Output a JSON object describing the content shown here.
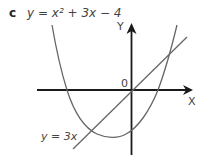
{
  "figure": {
    "part_label": "c",
    "curve_equation": "y = x² + 3x − 4",
    "line_equation": "y = 3x",
    "x_axis_label": "X",
    "y_axis_label": "Y",
    "origin_label": "0",
    "colors": {
      "axes": "#1a1a1a",
      "curves": "#666666",
      "text": "#444444"
    }
  }
}
